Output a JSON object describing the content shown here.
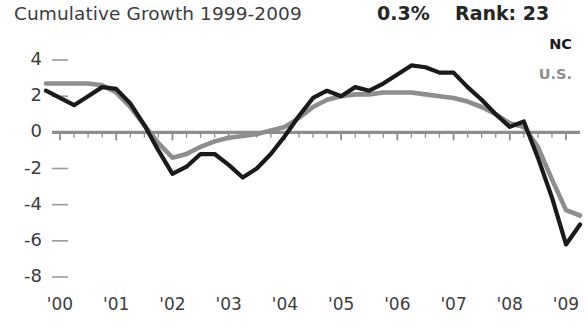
{
  "header": {
    "title": "Cumulative Growth 1999-2009",
    "value": "0.3%",
    "rank": "Rank: 23"
  },
  "legend": {
    "nc_label": "NC",
    "us_label": "U.S.",
    "nc_color": "#1a1a1a",
    "us_color": "#8e8e8e"
  },
  "chart_data": {
    "type": "line",
    "title": "Cumulative Growth 1999-2009",
    "xlabel": "",
    "ylabel": "",
    "ylim": [
      -8,
      4
    ],
    "xlim": [
      1999.5,
      2009.4
    ],
    "yticks": [
      4,
      2,
      0,
      -2,
      -4,
      -6,
      -8
    ],
    "ytick_labels": [
      "4",
      "2",
      "0",
      "-2",
      "-4",
      "-6",
      "-8"
    ],
    "xticks": [
      2000,
      2001,
      2002,
      2003,
      2004,
      2005,
      2006,
      2007,
      2008,
      2009
    ],
    "xtick_labels": [
      "'00",
      "'01",
      "'02",
      "'03",
      "'04",
      "'05",
      "'06",
      "'07",
      "'08",
      "'09"
    ],
    "grid": false,
    "zero_line": true,
    "legend_position": "upper-right",
    "series": [
      {
        "name": "NC",
        "color": "#1a1a1a",
        "x": [
          1999.75,
          2000.0,
          2000.25,
          2000.5,
          2000.75,
          2001.0,
          2001.25,
          2001.5,
          2001.75,
          2002.0,
          2002.25,
          2002.5,
          2002.75,
          2003.0,
          2003.25,
          2003.5,
          2003.75,
          2004.0,
          2004.25,
          2004.5,
          2004.75,
          2005.0,
          2005.25,
          2005.5,
          2005.75,
          2006.0,
          2006.25,
          2006.5,
          2006.75,
          2007.0,
          2007.25,
          2007.5,
          2007.75,
          2008.0,
          2008.25,
          2008.5,
          2008.75,
          2009.0,
          2009.25
        ],
        "y": [
          2.3,
          1.9,
          1.5,
          2.0,
          2.5,
          2.4,
          1.6,
          0.4,
          -1.0,
          -2.3,
          -1.9,
          -1.2,
          -1.2,
          -1.8,
          -2.5,
          -2.0,
          -1.2,
          -0.2,
          0.9,
          1.9,
          2.3,
          2.0,
          2.5,
          2.3,
          2.7,
          3.2,
          3.7,
          3.6,
          3.3,
          3.3,
          2.5,
          1.8,
          1.0,
          0.3,
          0.6,
          -1.4,
          -3.6,
          -6.2,
          -5.1
        ]
      },
      {
        "name": "U.S.",
        "color": "#8e8e8e",
        "x": [
          1999.75,
          2000.0,
          2000.25,
          2000.5,
          2000.75,
          2001.0,
          2001.25,
          2001.5,
          2001.75,
          2002.0,
          2002.25,
          2002.5,
          2002.75,
          2003.0,
          2003.25,
          2003.5,
          2003.75,
          2004.0,
          2004.25,
          2004.5,
          2004.75,
          2005.0,
          2005.25,
          2005.5,
          2005.75,
          2006.0,
          2006.25,
          2006.5,
          2006.75,
          2007.0,
          2007.25,
          2007.5,
          2007.75,
          2008.0,
          2008.25,
          2008.5,
          2008.75,
          2009.0,
          2009.25
        ],
        "y": [
          2.7,
          2.7,
          2.7,
          2.7,
          2.6,
          2.2,
          1.4,
          0.4,
          -0.6,
          -1.4,
          -1.2,
          -0.8,
          -0.5,
          -0.3,
          -0.2,
          -0.1,
          0.1,
          0.3,
          0.8,
          1.4,
          1.8,
          2.0,
          2.1,
          2.1,
          2.2,
          2.2,
          2.2,
          2.1,
          2.0,
          1.9,
          1.7,
          1.4,
          1.0,
          0.5,
          0.3,
          -0.8,
          -2.6,
          -4.3,
          -4.6
        ]
      }
    ]
  }
}
